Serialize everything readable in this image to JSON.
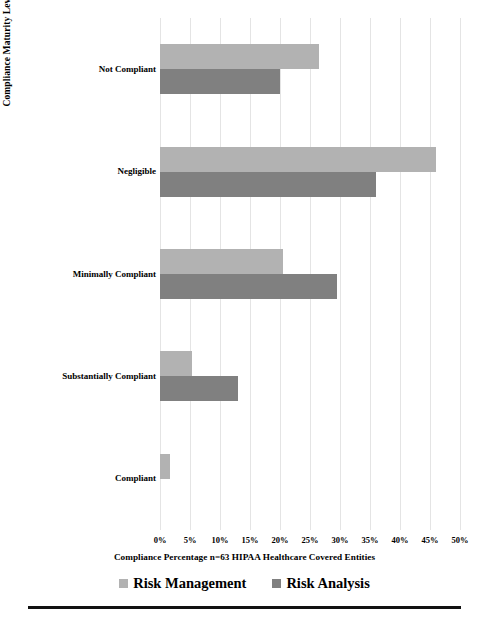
{
  "chart_data": {
    "type": "bar",
    "orientation": "horizontal",
    "title": "",
    "subtitle": "",
    "xlabel": "Compliance Percentage n=63 HIPAA Healthcare Covered Entities",
    "ylabel": "Compliance Maturity Level",
    "categories": [
      "Not Compliant",
      "Negligible",
      "Minimally Compliant",
      "Substantially Compliant",
      "Compliant"
    ],
    "series": [
      {
        "name": "Risk Management",
        "color": "#b2b2b2",
        "values": [
          26.5,
          46.0,
          20.5,
          5.3,
          1.6
        ]
      },
      {
        "name": "Risk Analysis",
        "color": "#808080",
        "values": [
          20.0,
          36.0,
          29.5,
          13.0,
          0.0
        ]
      }
    ],
    "xlim": [
      0,
      50
    ],
    "xtick_values": [
      0,
      5,
      10,
      15,
      20,
      25,
      30,
      35,
      40,
      45,
      50
    ],
    "xtick_labels": [
      "0%",
      "5%",
      "10%",
      "15%",
      "20%",
      "25%",
      "30%",
      "35%",
      "40%",
      "45%",
      "50%"
    ],
    "grid": "vertical",
    "legend_position": "bottom",
    "legend_entries": [
      "Risk Management",
      "Risk Analysis"
    ]
  }
}
